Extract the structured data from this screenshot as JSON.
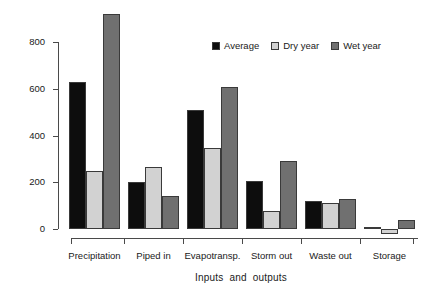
{
  "chart_data": {
    "type": "bar",
    "title": "",
    "subtitle": "",
    "xlabel": "Inputs  and  outputs",
    "ylabel": "Mean annual water balance (mm)",
    "categories": [
      "Precipitation",
      "Piped in",
      "Evapotransp.",
      "Storm out",
      "Waste out",
      "Storage"
    ],
    "series": [
      {
        "name": "Average",
        "color": "#0d0d0d",
        "values": [
          630,
          200,
          510,
          205,
          120,
          2
        ]
      },
      {
        "name": "Dry year",
        "color": "#d2d2d2",
        "values": [
          248,
          265,
          348,
          75,
          110,
          -20
        ]
      },
      {
        "name": "Wet year",
        "color": "#707070",
        "values": [
          920,
          140,
          608,
          290,
          128,
          38
        ]
      }
    ],
    "ylim": [
      -40,
      950
    ],
    "yticks": [
      0,
      200,
      400,
      600,
      800
    ],
    "ytick_labels": [
      "0",
      "200",
      "400",
      "600",
      "800"
    ],
    "grid": false,
    "legend_position": "top-right",
    "units": "mm"
  },
  "axes": {
    "y_title": "Mean annual water balance (mm)",
    "x_title": "Inputs  and  outputs",
    "y_tick_labels": [
      "800",
      "600",
      "400",
      "200",
      "0"
    ]
  },
  "legend": {
    "items": [
      {
        "label": "Average",
        "color": "#0d0d0d"
      },
      {
        "label": "Dry year",
        "color": "#d2d2d2"
      },
      {
        "label": "Wet year",
        "color": "#707070"
      }
    ]
  },
  "x_labels": [
    "Precipitation",
    "Piped in",
    "Evapotransp.",
    "Storm out",
    "Waste out",
    "Storage"
  ]
}
